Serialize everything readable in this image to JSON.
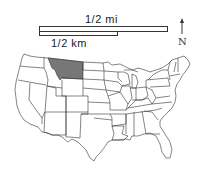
{
  "map": {
    "type": "us-states-locator",
    "highlighted_state": "Montana",
    "highlight_color": "#777777",
    "state_fill": "#ffffff",
    "border_color": "#333333"
  },
  "scale": {
    "miles_label": "1/2 mi",
    "km_label": "1/2 km"
  },
  "north_arrow": {
    "label": "N"
  }
}
